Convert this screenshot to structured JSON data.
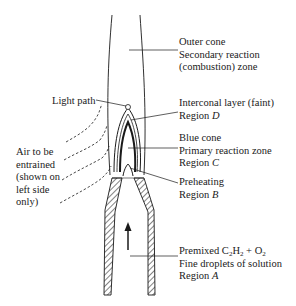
{
  "diagram": {
    "labels": {
      "outer_cone": {
        "line1": "Outer cone",
        "line2": "Secondary reaction",
        "line3": "(combustion) zone"
      },
      "light_path": "Light path",
      "interconal": {
        "line1": "Interconal layer (faint)",
        "line2_prefix": "Region ",
        "line2_region": "D"
      },
      "blue_cone": {
        "line1": "Blue cone",
        "line2": "Primary reaction zone",
        "line3_prefix": "Region ",
        "line3_region": "C"
      },
      "preheating": {
        "line1": "Preheating",
        "line2_prefix": "Region ",
        "line2_region": "B"
      },
      "air": {
        "line1": "Air to be",
        "line2": "entrained",
        "line3": "(shown on",
        "line4": "left side",
        "line5": "only)"
      },
      "premixed": {
        "line1_prefix": "Premixed C",
        "sub1": "2",
        "mid1": "H",
        "sub2": "2",
        "mid2": " + O",
        "sub3": "2",
        "line2": "Fine droplets of solution",
        "line3_prefix": "Region ",
        "line3_region": "A"
      }
    },
    "colors": {
      "ink": "#1a1a1a",
      "background": "#ffffff"
    }
  }
}
